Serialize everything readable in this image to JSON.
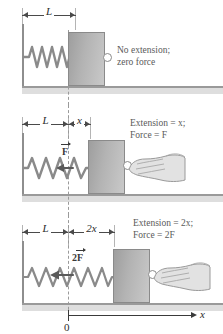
{
  "figure": {
    "colors": {
      "block_fill": "#b3b3b3",
      "spring": "#8a8a8a",
      "wall": "#8e8e8e",
      "ground": "#9a9a9a",
      "dashed_reference": "#9a9a9a",
      "caption_text": "#5a5a5a",
      "arrow": "#3a3a3a",
      "background": "#ffffff"
    }
  },
  "panels": [
    {
      "id": "panel-relaxed",
      "dimensions": [
        {
          "label": "L",
          "name": "natural-length"
        }
      ],
      "caption_line1": "No extension;",
      "caption_line2": "zero force",
      "force_label": "",
      "has_hand": false,
      "spring_coils": 6,
      "extension": "0"
    },
    {
      "id": "panel-extension-x",
      "dimensions": [
        {
          "label": "L",
          "name": "natural-length"
        },
        {
          "label": "x",
          "name": "extension-x"
        }
      ],
      "caption_line1": "Extension = x;",
      "caption_line2": "Force = F",
      "force_label": "F",
      "force_prefix": "",
      "has_hand": true,
      "spring_coils": 8,
      "extension": "x"
    },
    {
      "id": "panel-extension-2x",
      "dimensions": [
        {
          "label": "L",
          "name": "natural-length"
        },
        {
          "label": "2x",
          "name": "extension-2x"
        }
      ],
      "caption_line1": "Extension = 2x;",
      "caption_line2": "Force = 2F",
      "force_label": "F",
      "force_prefix": "2",
      "has_hand": true,
      "spring_coils": 10,
      "extension": "2x"
    }
  ],
  "axis": {
    "label": "x",
    "origin_label": "0"
  }
}
